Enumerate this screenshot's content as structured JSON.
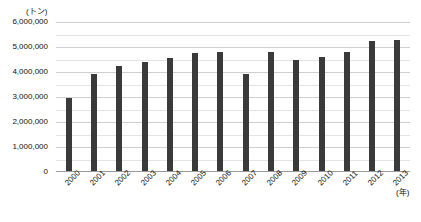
{
  "top_sliver_text": "",
  "axes": {
    "y_unit_label": "(トン)",
    "x_unit_label": "(年)",
    "y_ticks": [
      "6,000,000",
      "5,000,000",
      "4,000,000",
      "3,000,000",
      "2,000,000",
      "1,000,000",
      "0"
    ]
  },
  "colors": {
    "bar": "#3a3a3a",
    "gridline_major": "#cfcfcf",
    "gridline_minor": "#e4e4e4",
    "axis": "#9a9a9a",
    "text": "#111111",
    "background": "#ffffff"
  },
  "chart_data": {
    "type": "bar",
    "title": "",
    "xlabel": "(年)",
    "ylabel": "(トン)",
    "ylim": [
      0,
      6000000
    ],
    "ytick_step": 1000000,
    "minor_gridline_step": 500000,
    "grid": true,
    "legend": "none",
    "categories": [
      "2000",
      "2001",
      "2002",
      "2003",
      "2004",
      "2005",
      "2006",
      "2007",
      "2008",
      "2009",
      "2010",
      "2011",
      "2012",
      "2013"
    ],
    "values": [
      2950000,
      3920000,
      4230000,
      4400000,
      4550000,
      4780000,
      4800000,
      3930000,
      4800000,
      4500000,
      4600000,
      4800000,
      5250000,
      5280000
    ]
  }
}
